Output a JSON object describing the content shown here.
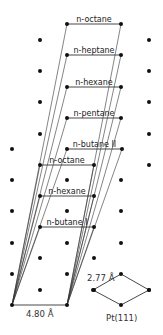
{
  "diagram": {
    "type": "adsorption-lattice",
    "substrate_label": "Pt(111)",
    "nn_distance_label": "2.77 Å",
    "base_vector_label": "4.80 Å",
    "colors": {
      "line": "#333333",
      "dot": "#111111",
      "background": "#ffffff"
    },
    "origin": {
      "left": [
        12,
        305
      ],
      "right": [
        67,
        305
      ]
    },
    "chains": [
      {
        "label": "n-octane",
        "y": 24,
        "x1": 67,
        "x2": 121
      },
      {
        "label": "n-heptane",
        "y": 55,
        "x1": 67,
        "x2": 121
      },
      {
        "label": "n-hexane",
        "y": 87,
        "x1": 67,
        "x2": 121
      },
      {
        "label": "n-pentane",
        "y": 118,
        "x1": 67,
        "x2": 121
      },
      {
        "label": "n-butane II",
        "y": 149,
        "x1": 67,
        "x2": 122
      },
      {
        "label": "n-octane",
        "y": 165,
        "x1": 40,
        "x2": 94
      },
      {
        "label": "n-hexane",
        "y": 196,
        "x1": 40,
        "x2": 94
      },
      {
        "label": "n-butane I",
        "y": 227,
        "x1": 40,
        "x2": 94
      }
    ],
    "lattice_dots": [
      [
        67,
        24
      ],
      [
        121,
        24
      ],
      [
        40,
        40
      ],
      [
        149,
        40
      ],
      [
        67,
        55
      ],
      [
        121,
        55
      ],
      [
        40,
        71
      ],
      [
        149,
        71
      ],
      [
        67,
        87
      ],
      [
        121,
        87
      ],
      [
        40,
        102
      ],
      [
        149,
        102
      ],
      [
        67,
        118
      ],
      [
        121,
        118
      ],
      [
        40,
        134
      ],
      [
        149,
        134
      ],
      [
        12,
        149
      ],
      [
        67,
        149
      ],
      [
        122,
        149
      ],
      [
        40,
        165
      ],
      [
        94,
        165
      ],
      [
        149,
        165
      ],
      [
        12,
        180
      ],
      [
        67,
        180
      ],
      [
        121,
        180
      ],
      [
        40,
        196
      ],
      [
        94,
        196
      ],
      [
        12,
        211
      ],
      [
        67,
        211
      ],
      [
        121,
        211
      ],
      [
        40,
        227
      ],
      [
        94,
        227
      ],
      [
        12,
        243
      ],
      [
        67,
        243
      ],
      [
        121,
        243
      ],
      [
        40,
        258
      ],
      [
        94,
        258
      ],
      [
        12,
        274
      ],
      [
        67,
        274
      ],
      [
        121,
        274
      ],
      [
        40,
        290
      ],
      [
        94,
        290
      ],
      [
        149,
        290
      ],
      [
        12,
        305
      ],
      [
        67,
        305
      ],
      [
        121,
        305
      ]
    ],
    "unit_cell": {
      "top": [
        121,
        274
      ],
      "left": [
        93,
        290
      ],
      "right": [
        149,
        290
      ],
      "bottom": [
        121,
        305
      ]
    }
  }
}
